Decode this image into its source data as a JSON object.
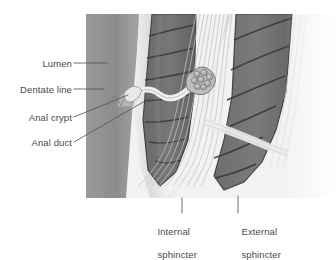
{
  "figure": {
    "type": "anatomical-illustration",
    "palette": {
      "background": "#ffffff",
      "lumen": "#8e8e8e",
      "mucosa_light": "#c9c9c9",
      "muscle_dark": "#6f6f6f",
      "muscle_outline": "#3c3c3c",
      "fiber_pale": "#e6e6e6",
      "gland": "#a8a8a8",
      "leader_line": "#5a5a5a",
      "label_text": "#4a4a4a"
    }
  },
  "labels": {
    "left": [
      {
        "id": "lumen",
        "text": "Lumen"
      },
      {
        "id": "dentate-line",
        "text": "Dentate line"
      },
      {
        "id": "anal-crypt",
        "text": "Anal crypt"
      },
      {
        "id": "anal-duct",
        "text": "Anal duct"
      }
    ],
    "bottom": [
      {
        "id": "internal-sphincter",
        "line1": "Internal",
        "line2": "sphincter"
      },
      {
        "id": "external-sphincter",
        "line1": "External",
        "line2": "sphincter"
      }
    ]
  }
}
